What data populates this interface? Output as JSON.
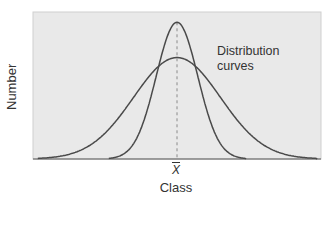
{
  "chart_data": {
    "type": "line",
    "title": "",
    "xlabel": "Class",
    "ylabel": "Number",
    "x_ticks": [
      {
        "label": "X̄",
        "position": "mean"
      }
    ],
    "annotation": {
      "line1": "Distribution",
      "line2": "curves"
    },
    "grid": false,
    "legend": null,
    "background": "#e9e9e9",
    "line_color": "#4a4a4a",
    "mean_line": {
      "style": "dashed",
      "color": "#8a8a8a",
      "x": 0
    },
    "x_range": [
      -4.3,
      4.3
    ],
    "y_range": [
      0,
      1.0
    ],
    "series": [
      {
        "name": "wide distribution (high variance)",
        "mean": 0,
        "sd": 1.3,
        "peak": 0.69
      },
      {
        "name": "narrow distribution (low variance)",
        "mean": 0,
        "sd": 0.62,
        "peak": 0.93
      }
    ]
  },
  "labels": {
    "ylabel": "Number",
    "xlabel": "Class",
    "xtick_mean": "X",
    "annotation_line1": "Distribution",
    "annotation_line2": "curves"
  }
}
